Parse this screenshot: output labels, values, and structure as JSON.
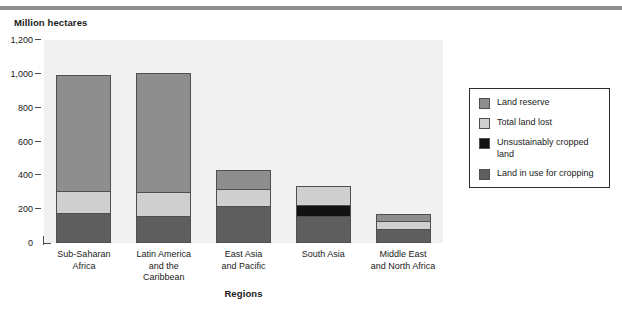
{
  "figure": {
    "y_axis_title": "Million hectares",
    "x_axis_title": "Regions"
  },
  "legend": {
    "items": [
      {
        "label": "Land reserve",
        "color": "#8e8e8e",
        "key": "land_reserve"
      },
      {
        "label": "Total land lost",
        "color": "#cfcfcf",
        "key": "total_land_lost"
      },
      {
        "label": "Unsustainably cropped land",
        "color": "#121212",
        "key": "unsustainably_cropped_land"
      },
      {
        "label": "Land in use for cropping",
        "color": "#5e5e5e",
        "key": "land_in_use_for_cropping"
      }
    ]
  },
  "chart_data": {
    "type": "bar",
    "subtype": "stacked",
    "title": "",
    "xlabel": "Regions",
    "ylabel": "Million hectares",
    "ylim": [
      0,
      1200
    ],
    "yticks": [
      "0",
      "200",
      "400",
      "600",
      "800",
      "1,000",
      "1,200"
    ],
    "ytick_values": [
      0,
      200,
      400,
      600,
      800,
      1000,
      1200
    ],
    "grid": false,
    "legend_position": "right",
    "categories": [
      "Sub-Saharan\nAfrica",
      "Latin America\nand the\nCaribbean",
      "East Asia\nand Pacific",
      "South Asia",
      "Middle East\nand North Africa"
    ],
    "series": [
      {
        "name": "Land in use for cropping",
        "color": "#5e5e5e",
        "values": [
          175,
          155,
          220,
          160,
          80
        ]
      },
      {
        "name": "Unsustainably cropped land",
        "color": "#121212",
        "values": [
          0,
          0,
          0,
          65,
          0
        ]
      },
      {
        "name": "Total land lost",
        "color": "#cfcfcf",
        "values": [
          130,
          145,
          105,
          110,
          55
        ]
      },
      {
        "name": "Land reserve",
        "color": "#8e8e8e",
        "values": [
          690,
          705,
          105,
          0,
          35
        ]
      }
    ],
    "totals": [
      995,
      1005,
      430,
      335,
      170
    ]
  }
}
